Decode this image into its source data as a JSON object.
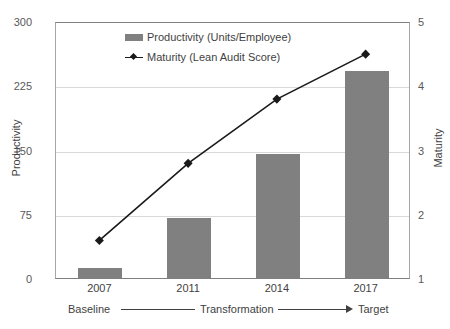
{
  "chart_data": {
    "type": "bar",
    "title": "",
    "subtitle": "",
    "categories": [
      "2007",
      "2011",
      "2014",
      "2017"
    ],
    "series": [
      {
        "name": "Productivity (Units/Employee)",
        "type": "bar",
        "axis": "left",
        "color": "#808080",
        "values": [
          12,
          70,
          145,
          242
        ]
      },
      {
        "name": "Maturity (Lean Audit Score)",
        "type": "line",
        "axis": "right",
        "color": "#1a1a1a",
        "marker": "diamond",
        "values": [
          1.6,
          2.8,
          3.8,
          4.5
        ]
      }
    ],
    "xlabel": "",
    "ylabel": "Productivity",
    "y2label": "Maturity",
    "ylim": [
      0,
      300
    ],
    "y2lim": [
      1,
      5
    ],
    "yticks": [
      0,
      75,
      150,
      225,
      300
    ],
    "y2ticks": [
      1,
      2,
      3,
      4,
      5
    ],
    "ytick_labels": [
      "0",
      "75",
      "150",
      "225",
      "300"
    ],
    "y2tick_labels": [
      "1",
      "2",
      "3",
      "4",
      "5"
    ],
    "grid": true,
    "legend_position": "top-center",
    "annotations": {
      "phase_baseline": "Baseline",
      "phase_transformation": "Transformation",
      "phase_target": "Target"
    }
  },
  "axes": {
    "left_title": "Productivity",
    "right_title": "Maturity"
  },
  "legend": {
    "items": [
      {
        "label": "Productivity (Units/Employee)",
        "swatch": "bar-swatch-icon"
      },
      {
        "label": "Maturity (Lean Audit Score)",
        "swatch": "line-marker-icon"
      }
    ]
  }
}
